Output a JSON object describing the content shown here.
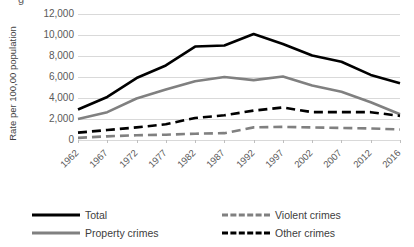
{
  "top_fragment": "g",
  "chart_data": {
    "type": "line",
    "title": "",
    "xlabel": "",
    "ylabel": "Rate per 100,00 population",
    "categories": [
      "1962",
      "1967",
      "1972",
      "1977",
      "1982",
      "1987",
      "1992",
      "1997",
      "2002",
      "2007",
      "2012",
      "2016"
    ],
    "ylim": [
      0,
      12000
    ],
    "ytick_labels": [
      "12,000",
      "10,000",
      "8,000",
      "6,000",
      "4,000",
      "2,000",
      "0"
    ],
    "ytick_values": [
      12000,
      10000,
      8000,
      6000,
      4000,
      2000,
      0
    ],
    "grid": "horizontal",
    "legend_position": "bottom",
    "series": [
      {
        "name": "Total",
        "style": "solid",
        "color": "#000000",
        "values": [
          2900,
          4100,
          5900,
          7100,
          8900,
          9000,
          10100,
          9150,
          8050,
          7450,
          6200,
          5400
        ]
      },
      {
        "name": "Property crimes",
        "style": "solid",
        "color": "#808080",
        "values": [
          2000,
          2650,
          3950,
          4800,
          5600,
          6000,
          5700,
          6050,
          5200,
          4600,
          3600,
          2450
        ]
      },
      {
        "name": "Violent crimes",
        "style": "dashed",
        "color": "#808080",
        "values": [
          200,
          350,
          450,
          500,
          600,
          650,
          1200,
          1250,
          1200,
          1150,
          1100,
          1000
        ]
      },
      {
        "name": "Other crimes",
        "style": "dashed",
        "color": "#000000",
        "values": [
          700,
          950,
          1200,
          1500,
          2100,
          2350,
          2800,
          3100,
          2650,
          2650,
          2650,
          2300
        ]
      }
    ]
  },
  "legend": {
    "items": [
      {
        "label": "Total",
        "swatch": "solid-black"
      },
      {
        "label": "Property crimes",
        "swatch": "solid-gray"
      },
      {
        "label": "Violent crimes",
        "swatch": "dash-gray"
      },
      {
        "label": "Other crimes",
        "swatch": "dash-black"
      }
    ]
  }
}
